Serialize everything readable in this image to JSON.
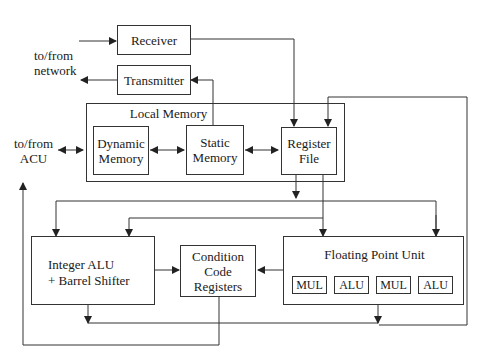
{
  "diagram": {
    "type": "processor-node-block-diagram",
    "external_labels": {
      "network": [
        "to/from",
        "network"
      ],
      "acu": [
        "to/from",
        "ACU"
      ]
    },
    "blocks": {
      "receiver": "Receiver",
      "transmitter": "Transmitter",
      "local_memory": "Local Memory",
      "dynamic_memory": [
        "Dynamic",
        "Memory"
      ],
      "static_memory": [
        "Static",
        "Memory"
      ],
      "register_file": [
        "Register",
        "File"
      ],
      "integer_alu": [
        "Integer ALU",
        "+ Barrel Shifter"
      ],
      "condition_code": [
        "Condition",
        "Code",
        "Registers"
      ],
      "fpu": "Floating Point Unit",
      "fpu_units": [
        "MUL",
        "ALU",
        "MUL",
        "ALU"
      ]
    },
    "colors": {
      "line": "#333333",
      "background": "#ffffff"
    }
  }
}
